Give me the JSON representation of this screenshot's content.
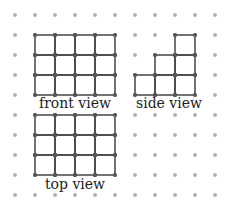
{
  "diagram": {
    "grid": {
      "spacing": 20,
      "origin_x": 15,
      "origin_y": 15,
      "cols": 11,
      "rows": 10,
      "dot_color": "#b0b0b0"
    },
    "line_color": "#444444",
    "views": [
      {
        "name": "front view",
        "label": "front view",
        "cells": [
          [
            0,
            0
          ],
          [
            1,
            0
          ],
          [
            2,
            0
          ],
          [
            3,
            0
          ],
          [
            0,
            1
          ],
          [
            1,
            1
          ],
          [
            2,
            1
          ],
          [
            3,
            1
          ],
          [
            0,
            2
          ],
          [
            1,
            2
          ],
          [
            2,
            2
          ],
          [
            3,
            2
          ]
        ],
        "origin": [
          35,
          35
        ]
      },
      {
        "name": "side view",
        "label": "side view",
        "cells": [
          [
            2,
            0
          ],
          [
            1,
            1
          ],
          [
            2,
            1
          ],
          [
            0,
            2
          ],
          [
            1,
            2
          ],
          [
            2,
            2
          ]
        ],
        "origin": [
          135,
          35
        ]
      },
      {
        "name": "top view",
        "label": "top view",
        "cells": [
          [
            0,
            0
          ],
          [
            1,
            0
          ],
          [
            2,
            0
          ],
          [
            3,
            0
          ],
          [
            0,
            1
          ],
          [
            1,
            1
          ],
          [
            2,
            1
          ],
          [
            3,
            1
          ],
          [
            0,
            2
          ],
          [
            1,
            2
          ],
          [
            2,
            2
          ],
          [
            3,
            2
          ]
        ],
        "origin": [
          35,
          115
        ]
      }
    ]
  }
}
